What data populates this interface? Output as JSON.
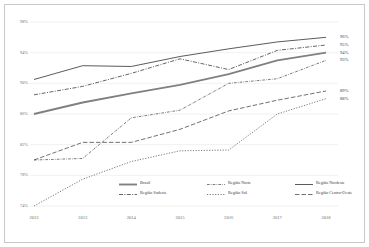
{
  "chart_data": {
    "type": "line",
    "title": "",
    "subtitle": "",
    "xlabel": "",
    "ylabel": "",
    "categories": [
      "2012",
      "2013",
      "2014",
      "2015",
      "2016",
      "2017",
      "2018"
    ],
    "x": [
      2012,
      2013,
      2014,
      2015,
      2016,
      2017,
      2018
    ],
    "ylim": [
      74,
      98
    ],
    "yticks": [
      74,
      78,
      82,
      86,
      90,
      94,
      98
    ],
    "ytick_labels": [
      "74%",
      "78%",
      "82%",
      "86%",
      "90%",
      "94%",
      "98%"
    ],
    "xtick_labels": [
      "2012",
      "2013",
      "2014",
      "2015",
      "2016",
      "2017",
      "2018"
    ],
    "grid": true,
    "grid_axis": "y",
    "legend_position": "bottom-inside",
    "legend_columns": 3,
    "value_suffix": "%",
    "series": [
      {
        "name": "Brasil",
        "style": "solid-thick",
        "color": "#808080",
        "values": [
          86.0,
          87.5,
          88.7,
          89.8,
          91.2,
          93.0,
          94.0
        ],
        "end_label": "94%"
      },
      {
        "name": "Região Norte",
        "style": "dash-dot-fine",
        "color": "#4d4d4d",
        "values": [
          80.0,
          80.2,
          85.5,
          86.5,
          90.0,
          90.6,
          93.0
        ],
        "end_label": "93%"
      },
      {
        "name": "Região Nordeste",
        "style": "solid-thin",
        "color": "#3d3d3d",
        "values": [
          90.5,
          92.3,
          92.2,
          93.5,
          94.5,
          95.4,
          96.0
        ],
        "end_label": "96%"
      },
      {
        "name": "Região Sudeste",
        "style": "dash-dot",
        "color": "#3d3d3d",
        "values": [
          88.5,
          89.6,
          91.3,
          93.2,
          91.8,
          94.3,
          95.0
        ],
        "end_label": "95%"
      },
      {
        "name": "Região Sul",
        "style": "dotted",
        "color": "#4d4d4d",
        "values": [
          74.0,
          77.5,
          79.8,
          81.2,
          81.3,
          86.0,
          88.0
        ],
        "end_label": "88%"
      },
      {
        "name": "Região Centro-Oeste",
        "style": "long-dash",
        "color": "#4d4d4d",
        "values": [
          80.0,
          82.3,
          82.3,
          84.0,
          86.4,
          87.8,
          89.0
        ],
        "end_label": "89%"
      }
    ],
    "end_labels": [
      {
        "text": "96%",
        "series": "Região Nordeste",
        "value": 96.0
      },
      {
        "text": "95%",
        "series": "Região Sudeste",
        "value": 95.0
      },
      {
        "text": "94%",
        "series": "Brasil",
        "value": 94.0
      },
      {
        "text": "93%",
        "series": "Região Norte",
        "value": 93.0
      },
      {
        "text": "89%",
        "series": "Região Centro-Oeste",
        "value": 89.0
      },
      {
        "text": "88%",
        "series": "Região Sul",
        "value": 88.0
      }
    ],
    "legend": [
      {
        "label": "Brasil",
        "style": "solid-thick",
        "col": 0,
        "row": 0
      },
      {
        "label": "Região Norte",
        "style": "dash-dot-fine",
        "col": 1,
        "row": 0
      },
      {
        "label": "Região Nordeste",
        "style": "solid-thin",
        "col": 2,
        "row": 0
      },
      {
        "label": "Região Sudeste",
        "style": "dash-dot",
        "col": 0,
        "row": 1
      },
      {
        "label": "Região Sul",
        "style": "dotted",
        "col": 1,
        "row": 1
      },
      {
        "label": "Região Centro-Oeste",
        "style": "long-dash",
        "col": 2,
        "row": 1
      }
    ],
    "colors": {
      "background": "#ffffff",
      "border": "#c9c9c9",
      "gridline": "#e6e6e6",
      "tick_text": "#6e6e6e",
      "label_text": "#3d3d3d",
      "brasil": "#808080",
      "series_dark": "#3d3d3d",
      "series_mid": "#4d4d4d"
    }
  }
}
